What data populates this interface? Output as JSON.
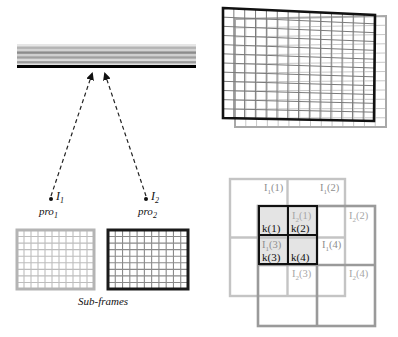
{
  "scanner_bar": {
    "label": "",
    "stripe_colors": [
      "#e6e6e6",
      "#b4b4b4",
      "#d2d2d2",
      "#8c8c8c",
      "#cfcfcf",
      "#a0a0a0",
      "#dadada",
      "#9a9a9a",
      "#e0e0e0"
    ],
    "base_color": "#000000"
  },
  "projectors": [
    {
      "id": "I1",
      "label_main": "I",
      "label_sub": "1",
      "pro_main": "pro",
      "pro_sub": "1"
    },
    {
      "id": "I2",
      "label_main": "I",
      "label_sub": "2",
      "pro_main": "pro",
      "pro_sub": "2"
    }
  ],
  "subframes": {
    "caption": "Sub-frames",
    "frame1": {
      "border_color": "#b4b4b4",
      "cols": 11,
      "rows": 9
    },
    "frame2": {
      "border_color": "#1a1a1a",
      "cols": 11,
      "rows": 9
    }
  },
  "overlap_frames": {
    "front_color": "#111111",
    "back_color": "#a8a8a8",
    "grid_cols": 14,
    "grid_rows": 12
  },
  "pixel_grid": {
    "i1_color": "#c4c4c4",
    "i2_color": "#9a9a9a",
    "k_color": "#111111",
    "k_fill": "#e4e4e4",
    "i1_labels": [
      {
        "main": "I",
        "sub": "1",
        "idx": "(1)"
      },
      {
        "main": "I",
        "sub": "1",
        "idx": "(2)"
      },
      {
        "main": "I",
        "sub": "1",
        "idx": "(3)"
      },
      {
        "main": "I",
        "sub": "1",
        "idx": "(4)"
      }
    ],
    "i2_labels": [
      {
        "main": "I",
        "sub": "2",
        "idx": "(1)"
      },
      {
        "main": "I",
        "sub": "2",
        "idx": "(2)"
      },
      {
        "main": "I",
        "sub": "2",
        "idx": "(3)"
      },
      {
        "main": "I",
        "sub": "2",
        "idx": "(4)"
      }
    ],
    "k_labels": [
      "k(1)",
      "k(2)",
      "k(3)",
      "k(4)"
    ]
  }
}
